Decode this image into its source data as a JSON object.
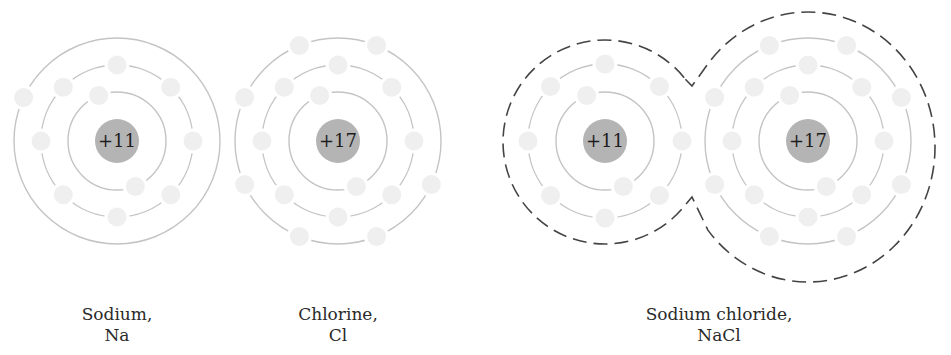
{
  "colors": {
    "background": "#ffffff",
    "nucleus": "#b4b4b4",
    "electron": "#efefef",
    "shell": "#c4c4c4",
    "boundary": "#444444",
    "text": "#2a2a2a"
  },
  "atoms": [
    {
      "id": "sodium",
      "charge_label": "+11",
      "center": [
        117,
        141
      ],
      "nucleus_radius": 22,
      "shells": [
        {
          "radius": 49,
          "angles": [
            -112,
            68
          ]
        },
        {
          "radius": 76,
          "angles": [
            -90,
            -135,
            -45,
            180,
            0,
            135,
            45,
            90
          ]
        },
        {
          "radius": 103,
          "angles": [
            -155
          ]
        }
      ],
      "caption": {
        "line1": "Sodium,",
        "line2": "Na"
      }
    },
    {
      "id": "chlorine",
      "charge_label": "+17",
      "center": [
        338,
        141
      ],
      "nucleus_radius": 22,
      "shells": [
        {
          "radius": 49,
          "angles": [
            -112,
            68
          ]
        },
        {
          "radius": 76,
          "angles": [
            -90,
            -135,
            -45,
            180,
            0,
            135,
            45,
            90
          ]
        },
        {
          "radius": 103,
          "angles": [
            -112,
            -68,
            -155,
            25,
            155,
            112,
            68
          ]
        }
      ],
      "caption": {
        "line1": "Chlorine,",
        "line2": "Cl"
      }
    }
  ],
  "compound": {
    "id": "sodium-chloride",
    "caption": {
      "line1": "Sodium chloride,",
      "line2": "NaCl"
    },
    "ions": [
      {
        "id": "sodium-ion",
        "charge_label": "+11",
        "center": [
          605,
          141
        ],
        "nucleus_radius": 22,
        "shells": [
          {
            "radius": 49,
            "angles": [
              -112,
              68
            ]
          },
          {
            "radius": 77,
            "angles": [
              -90,
              -135,
              -45,
              180,
              0,
              135,
              45,
              90
            ]
          }
        ]
      },
      {
        "id": "chloride-ion",
        "charge_label": "+17",
        "center": [
          808,
          141
        ],
        "nucleus_radius": 22,
        "shells": [
          {
            "radius": 49,
            "angles": [
              -112,
              68
            ]
          },
          {
            "radius": 76,
            "angles": [
              -90,
              -135,
              -45,
              180,
              0,
              135,
              45,
              90
            ]
          },
          {
            "radius": 103,
            "angles": [
              -112,
              -68,
              -155,
              -25,
              155,
              25,
              112,
              68
            ]
          }
        ]
      }
    ],
    "boundary": {
      "na": {
        "cx": 605,
        "cy": 142,
        "r": 102
      },
      "cl": {
        "cx": 808,
        "cy": 147,
        "rx": 127,
        "ry": 135
      },
      "notch_top": [
        692,
        86
      ],
      "notch_bottom": [
        692,
        197
      ]
    }
  },
  "captions_layout": [
    {
      "bind": "atoms.0.caption",
      "cx": 117,
      "top": 304
    },
    {
      "bind": "atoms.1.caption",
      "cx": 338,
      "top": 304
    },
    {
      "bind": "compound.caption",
      "cx": 719,
      "top": 304
    }
  ]
}
